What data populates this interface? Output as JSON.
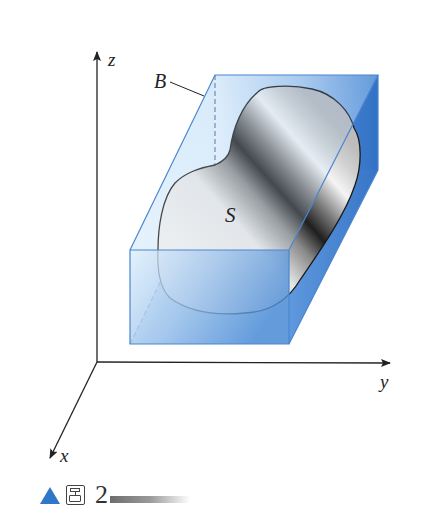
{
  "figure": {
    "type": "3d-box-enclosing-surface",
    "labels": {
      "z_axis": "z",
      "y_axis": "y",
      "x_axis": "x",
      "box": "B",
      "surface": "S"
    },
    "colors": {
      "box_fill_light": "#dceefb",
      "box_fill_dark": "#3b7fd0",
      "box_edge": "#4a86d0",
      "surface_light": "#f2f2f2",
      "surface_dark": "#1e1e1e",
      "axis": "#222222",
      "caption_triangle": "#2f78c8"
    }
  },
  "caption": {
    "marker": "triangle-icon",
    "label_glyph": "图",
    "number": "2"
  }
}
